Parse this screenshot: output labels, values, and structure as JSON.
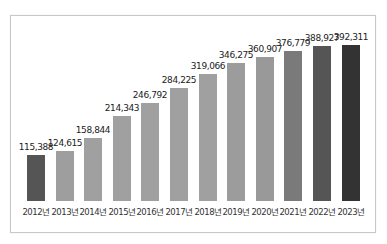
{
  "chart_data": {
    "type": "bar",
    "title": "",
    "xlabel": "",
    "ylabel": "",
    "categories": [
      "2012년",
      "2013년",
      "2014년",
      "2015년",
      "2016년",
      "2017년",
      "2018년",
      "2019년",
      "2020년",
      "2021년",
      "2022년",
      "2023년"
    ],
    "values": [
      115388,
      124615,
      158844,
      214343,
      246792,
      284225,
      319066,
      346275,
      360907,
      376779,
      388927,
      392311
    ],
    "value_labels": [
      "115,388",
      "124,615",
      "158,844",
      "214,343",
      "246,792",
      "284,225",
      "319,066",
      "346,275",
      "360,907",
      "376,779",
      "388,927",
      "392,311"
    ],
    "colors": [
      "#555555",
      "#9e9e9e",
      "#a0a0a0",
      "#a0a0a0",
      "#a0a0a0",
      "#a0a0a0",
      "#a0a0a0",
      "#9c9c9c",
      "#999999",
      "#7a7a7a",
      "#555555",
      "#333333"
    ],
    "ylim": [
      0,
      400000
    ],
    "grid": false,
    "legend": "none"
  }
}
